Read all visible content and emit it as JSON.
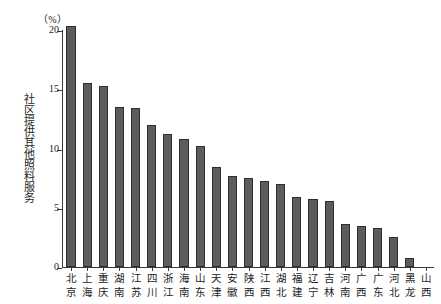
{
  "chart_data": {
    "type": "bar",
    "title": "",
    "subtitle": "",
    "unit_label": "（%）",
    "xlabel": "",
    "ylabel": "社区提供其他照料服务",
    "ylim": [
      0,
      20
    ],
    "yticks": [
      0,
      5,
      10,
      15,
      20
    ],
    "ytick_labels": [
      "0",
      "5",
      "10",
      "15",
      "20"
    ],
    "grid": false,
    "legend": null,
    "bar_color": "#5c5c5c",
    "bar_edge_color": "#2e2e2e",
    "axis_color": "#3a3a3a",
    "categories": [
      "北京",
      "上海",
      "重庆",
      "湖南",
      "江苏",
      "四川",
      "浙江",
      "海南",
      "山东",
      "天津",
      "安徽",
      "陕西",
      "江西",
      "湖北",
      "福建",
      "辽宁",
      "吉林",
      "河南",
      "广西",
      "广东",
      "河北",
      "黑龙",
      "山西"
    ],
    "category_lines": [
      [
        "北",
        "京"
      ],
      [
        "上",
        "海"
      ],
      [
        "重",
        "庆"
      ],
      [
        "湖",
        "南"
      ],
      [
        "江",
        "苏"
      ],
      [
        "四",
        "川"
      ],
      [
        "浙",
        "江"
      ],
      [
        "海",
        "南"
      ],
      [
        "山",
        "东"
      ],
      [
        "天",
        "津"
      ],
      [
        "安",
        "徽"
      ],
      [
        "陕",
        "西"
      ],
      [
        "江",
        "西"
      ],
      [
        "湖",
        "北"
      ],
      [
        "福",
        "建"
      ],
      [
        "辽",
        "宁"
      ],
      [
        "吉",
        "林"
      ],
      [
        "河",
        "南"
      ],
      [
        "广",
        "西"
      ],
      [
        "广",
        "东"
      ],
      [
        "河",
        "北"
      ],
      [
        "黑",
        "龙"
      ],
      [
        "山",
        "西"
      ]
    ],
    "values": [
      20.3,
      15.5,
      15.3,
      13.5,
      13.4,
      12.0,
      11.2,
      10.8,
      10.2,
      8.4,
      7.7,
      7.5,
      7.3,
      7.0,
      5.9,
      5.7,
      5.6,
      3.6,
      3.5,
      3.3,
      2.5,
      0.8,
      0.0
    ]
  }
}
